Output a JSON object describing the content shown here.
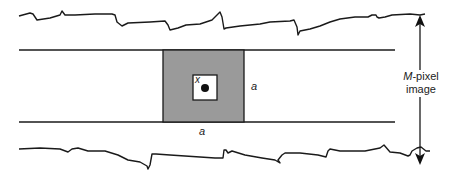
{
  "diagram": {
    "labels": {
      "center_pixel": "x",
      "window_side_right": "a",
      "window_side_bottom": "a",
      "image_size_var": "M",
      "image_size_suffix": "-pixel",
      "image_size_line2": "image"
    },
    "colors": {
      "stroke": "#1a1a1a",
      "window_fill": "#9a9a9a",
      "inner_box_fill": "#ffffff",
      "background": "#ffffff"
    },
    "elements": [
      "torn top edge of image strip",
      "torn bottom edge of image strip",
      "horizontal strip (two parallel lines)",
      "gray a×a square window",
      "inner white box with center pixel x (black dot)",
      "vertical double-headed arrow indicating M-pixel image height"
    ]
  }
}
